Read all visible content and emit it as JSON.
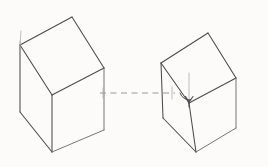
{
  "drawing": {
    "title": "Two cubes in parallel projection with connecting axis line",
    "medium": "pencil sketch",
    "background_color": "#fdfdfc",
    "ink_color": "#4a4a4e",
    "faint_ink_color": "#a9a9ae",
    "dashed_line_color": "#8d8d92",
    "canvas": {
      "width": 268,
      "height": 167
    }
  },
  "shapes": {
    "left_cube": {
      "name": "left-cube",
      "label": "",
      "top_face": "M20,45 L72,17 L104,68 L52,95 Z",
      "left_face": "M20,45 L52,95 L52,152 L20,112 Z",
      "right_face": "M52,95 L104,68 L104,130 L52,152 Z",
      "vertices": {
        "top_back": [
          72,
          17
        ],
        "top_left": [
          20,
          45
        ],
        "top_right": [
          104,
          68
        ],
        "top_front": [
          52,
          95
        ],
        "bottom_left": [
          20,
          112
        ],
        "bottom_front": [
          52,
          152
        ],
        "bottom_right": [
          104,
          130
        ]
      },
      "tick_mark": "M20,45 L21,31"
    },
    "right_cube": {
      "name": "right-cube",
      "label": "",
      "top_face": "M161,63 L208,33 L236,78 L189,103 Z",
      "left_face": "M161,63 L189,103 L196,152 L163,118 Z",
      "right_face": "M189,103 L236,78 L236,128 L196,152 Z",
      "vertices": {
        "top_back": [
          208,
          33
        ],
        "top_left": [
          161,
          63
        ],
        "top_right": [
          236,
          78
        ],
        "top_front": [
          189,
          103
        ],
        "bottom_left": [
          163,
          118
        ],
        "bottom_front": [
          196,
          152
        ],
        "bottom_right": [
          236,
          128
        ]
      },
      "vertical_tick": "M189,73 L189,103",
      "angle_arc": "M181,92 A9,9 0 0 0 192,99",
      "arrow_head": "M189,97 L186,92 M189,97 L193,92"
    },
    "connector": {
      "name": "axis-dashed-line",
      "label": "",
      "path": "M100,93 L175,93",
      "style": "dashed"
    }
  },
  "annotations": {
    "left_tick_label": "",
    "right_angle_label": "",
    "notes": ""
  }
}
